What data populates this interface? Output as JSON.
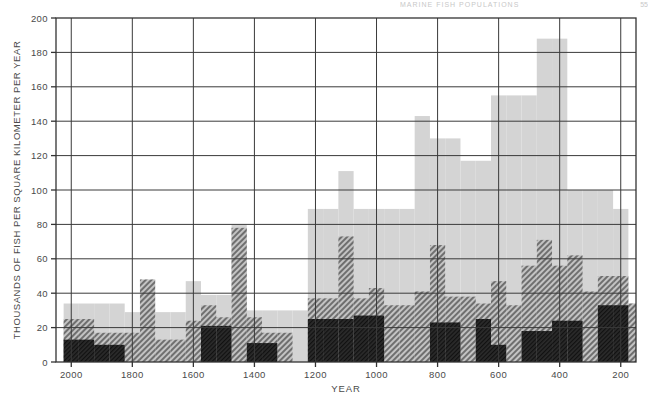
{
  "page": {
    "header_sliver": "MARINE FISH POPULATIONS",
    "page_number": "55"
  },
  "chart_data": {
    "type": "bar",
    "title": "",
    "subtitle": "",
    "xlabel": "YEAR",
    "ylabel": "THOUSANDS OF FISH PER SQUARE KILOMETER PER YEAR",
    "xlim": [
      2050,
      150
    ],
    "ylim": [
      0,
      200
    ],
    "x_reversed": true,
    "grid": true,
    "legend_position": "none",
    "x_ticks": [
      2000,
      1800,
      1600,
      1400,
      1200,
      1000,
      800,
      600,
      400,
      200
    ],
    "y_ticks": [
      0,
      20,
      40,
      60,
      80,
      100,
      120,
      140,
      160,
      180,
      200
    ],
    "y_gridlines": [
      0,
      20,
      40,
      60,
      80,
      100,
      120,
      140,
      160,
      180,
      200
    ],
    "x_gridlines": [
      2000,
      1800,
      1600,
      1400,
      1200,
      1000,
      800,
      600,
      400,
      200
    ],
    "bin_width_years": 50,
    "bin_starts": [
      2025,
      1975,
      1925,
      1875,
      1825,
      1775,
      1725,
      1675,
      1625,
      1575,
      1525,
      1475,
      1425,
      1375,
      1325,
      1275,
      1225,
      1175,
      1125,
      1075,
      1025,
      975,
      925,
      875,
      825,
      775,
      725,
      675,
      625,
      575,
      525,
      475,
      425,
      375,
      325,
      275,
      225,
      175
    ],
    "bin_centers": [
      2000,
      1950,
      1900,
      1850,
      1800,
      1750,
      1700,
      1650,
      1600,
      1550,
      1500,
      1450,
      1400,
      1350,
      1300,
      1250,
      1200,
      1150,
      1100,
      1050,
      1000,
      950,
      900,
      850,
      800,
      750,
      700,
      650,
      600,
      550,
      500,
      450,
      400,
      350,
      300,
      250,
      200,
      150
    ],
    "series": [
      {
        "name": "Total abundance",
        "style": "light-gray-fill",
        "color": "#d4d4d4",
        "values": [
          34,
          34,
          34,
          34,
          29,
          29,
          29,
          29,
          47,
          39,
          39,
          80,
          30,
          30,
          30,
          30,
          89,
          89,
          111,
          89,
          89,
          89,
          89,
          143,
          130,
          130,
          117,
          117,
          155,
          155,
          155,
          188,
          188,
          100,
          100,
          100,
          89,
          34
        ]
      },
      {
        "name": "Intermediate group",
        "style": "medium-gray-diagonal-hatch",
        "color": "#8a8a8a",
        "values": [
          25,
          25,
          17,
          17,
          17,
          48,
          13,
          13,
          24,
          33,
          26,
          78,
          26,
          17,
          17,
          0,
          37,
          37,
          73,
          37,
          43,
          33,
          33,
          41,
          68,
          38,
          38,
          34,
          47,
          33,
          56,
          71,
          56,
          62,
          41,
          50,
          50,
          34
        ]
      },
      {
        "name": "Target species",
        "style": "dark-solid",
        "color": "#2b2b2b",
        "values": [
          13,
          13,
          10,
          10,
          0,
          0,
          0,
          0,
          0,
          21,
          21,
          0,
          11,
          11,
          0,
          0,
          25,
          25,
          25,
          27,
          27,
          0,
          0,
          0,
          23,
          23,
          0,
          25,
          10,
          0,
          18,
          18,
          24,
          24,
          0,
          33,
          33,
          0
        ]
      }
    ]
  }
}
